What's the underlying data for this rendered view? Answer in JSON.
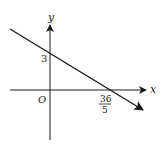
{
  "diagram": {
    "type": "coordinate-plane-line",
    "axes": {
      "x_label": "x",
      "y_label": "y",
      "origin_label": "O"
    },
    "line": {
      "y_intercept_label": "3",
      "x_intercept_numerator": "36",
      "x_intercept_denominator": "5",
      "y_intercept": 3,
      "x_intercept": 7.2,
      "slope_direction": "negative"
    },
    "colors": {
      "stroke": "#1a1a1a",
      "background": "#ffffff"
    }
  }
}
